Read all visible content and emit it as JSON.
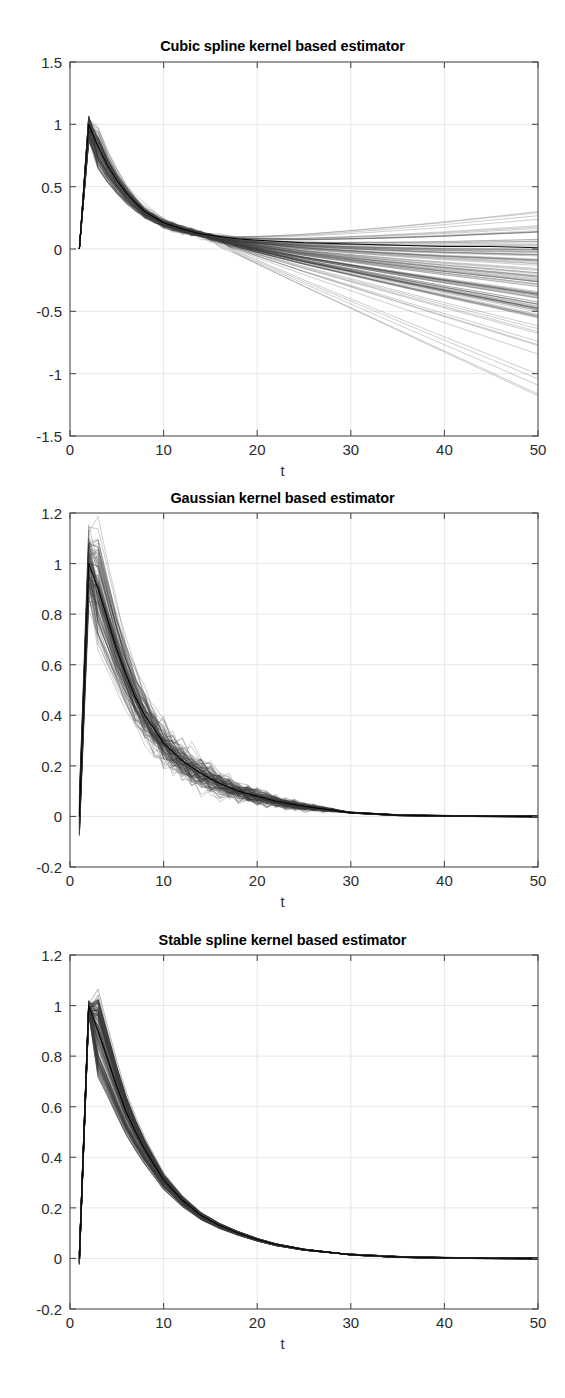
{
  "page": {
    "width": 565,
    "height": 1398,
    "background": "#ffffff",
    "axis_color": "#4d4d4d",
    "grid_color": "#e6e6e6",
    "curve_color": "#3a3a3a",
    "mean_color": "#000000"
  },
  "chart_data": [
    {
      "id": "cubic-spline",
      "type": "line",
      "title": "Cubic spline kernel based estimator",
      "xlabel": "t",
      "ylabel": "",
      "xlim": [
        0,
        50
      ],
      "ylim": [
        -1.5,
        1.5
      ],
      "xticks": [
        0,
        10,
        20,
        30,
        40,
        50
      ],
      "yticks": [
        -1.5,
        -1,
        -0.5,
        0,
        0.5,
        1,
        1.5
      ],
      "ytick_labels": [
        "-1.5",
        "-1",
        "-0.5",
        "0",
        "0.5",
        "1",
        "1.5"
      ],
      "xtick_labels": [
        "0",
        "10",
        "20",
        "30",
        "40",
        "50"
      ],
      "grid": true,
      "legend": null,
      "n_curves": 120,
      "description": "Bundle of impulse response estimates; sharp peak near t=2 at about 1.0, decaying to near 0 by t=20, then fanning out linearly and diverging between +1.0 and -1.3 at t=50.",
      "reference": {
        "x": [
          1,
          2,
          3,
          4,
          5,
          6,
          7,
          8,
          10,
          12,
          14,
          16,
          18,
          20,
          25,
          30,
          35,
          40,
          45,
          50
        ],
        "y": [
          0,
          1.0,
          0.82,
          0.67,
          0.55,
          0.45,
          0.37,
          0.3,
          0.21,
          0.16,
          0.12,
          0.1,
          0.08,
          0.07,
          0.05,
          0.04,
          0.03,
          0.02,
          0.02,
          0.01
        ]
      },
      "spread": {
        "peak_min": 0.86,
        "peak_max": 1.07,
        "t50_min": -1.3,
        "t50_max": 1.0,
        "t50_dense_min": -0.55,
        "t50_dense_max": 0.2,
        "noise": 0.012,
        "fan_start_t": 14
      }
    },
    {
      "id": "gaussian",
      "type": "line",
      "title": "Gaussian kernel based estimator",
      "xlabel": "t",
      "ylabel": "",
      "xlim": [
        0,
        50
      ],
      "ylim": [
        -0.2,
        1.2
      ],
      "xticks": [
        0,
        10,
        20,
        30,
        40,
        50
      ],
      "yticks": [
        -0.2,
        0,
        0.2,
        0.4,
        0.6,
        0.8,
        1,
        1.2
      ],
      "ytick_labels": [
        "-0.2",
        "0",
        "0.2",
        "0.4",
        "0.6",
        "0.8",
        "1",
        "1.2"
      ],
      "xtick_labels": [
        "0",
        "10",
        "20",
        "30",
        "40",
        "50"
      ],
      "grid": true,
      "legend": null,
      "n_curves": 120,
      "description": "Bundle of impulse response estimates rising from 0 at t=1 to a peak near 1.0-1.1 at t=2, then decaying with visible zigzag noise, converging to 0 by t=30 and flat thereafter.",
      "reference": {
        "x": [
          1,
          2,
          3,
          4,
          5,
          6,
          7,
          8,
          10,
          12,
          14,
          16,
          18,
          20,
          22,
          25,
          30,
          35,
          40,
          45,
          50
        ],
        "y": [
          0,
          1.0,
          0.9,
          0.78,
          0.66,
          0.56,
          0.47,
          0.4,
          0.29,
          0.22,
          0.17,
          0.13,
          0.1,
          0.08,
          0.06,
          0.04,
          0.015,
          0.005,
          0.002,
          0.001,
          0.0
        ]
      },
      "spread": {
        "peak_min": 0.88,
        "peak_max": 1.1,
        "band": 0.055,
        "noise": 0.035,
        "noise_end_t": 30
      }
    },
    {
      "id": "stable-spline",
      "type": "line",
      "title": "Stable spline kernel based estimator",
      "xlabel": "t",
      "ylabel": "",
      "xlim": [
        0,
        50
      ],
      "ylim": [
        -0.2,
        1.2
      ],
      "xticks": [
        0,
        10,
        20,
        30,
        40,
        50
      ],
      "yticks": [
        -0.2,
        0,
        0.2,
        0.4,
        0.6,
        0.8,
        1,
        1.2
      ],
      "ytick_labels": [
        "-0.2",
        "0",
        "0.2",
        "0.4",
        "0.6",
        "0.8",
        "1",
        "1.2"
      ],
      "xtick_labels": [
        "0",
        "10",
        "20",
        "30",
        "40",
        "50"
      ],
      "grid": true,
      "legend": null,
      "n_curves": 120,
      "description": "Very tight bundle of impulse response estimates: rises from 0 at t=1 to 1.0 at t=2, smooth exponential-like decay reaching near 0 by t=30, essentially no visible spread.",
      "reference": {
        "x": [
          1,
          2,
          3,
          4,
          5,
          6,
          7,
          8,
          10,
          12,
          14,
          16,
          18,
          20,
          22,
          25,
          30,
          35,
          40,
          45,
          50
        ],
        "y": [
          0,
          1.0,
          0.9,
          0.79,
          0.68,
          0.58,
          0.5,
          0.43,
          0.31,
          0.23,
          0.17,
          0.13,
          0.1,
          0.075,
          0.055,
          0.035,
          0.015,
          0.006,
          0.002,
          0.001,
          0.0
        ]
      },
      "spread": {
        "peak_min": 0.97,
        "peak_max": 1.0,
        "band": 0.018,
        "noise": 0.0,
        "noise_end_t": 30
      }
    }
  ],
  "layout": [
    {
      "chart": 0,
      "title_y": 38,
      "plot_left": 70,
      "plot_top": 62,
      "plot_width": 468,
      "plot_height": 374
    },
    {
      "chart": 1,
      "title_y": 490,
      "plot_left": 70,
      "plot_top": 513,
      "plot_width": 468,
      "plot_height": 354
    },
    {
      "chart": 2,
      "title_y": 932,
      "plot_left": 70,
      "plot_top": 955,
      "plot_width": 468,
      "plot_height": 354
    }
  ]
}
